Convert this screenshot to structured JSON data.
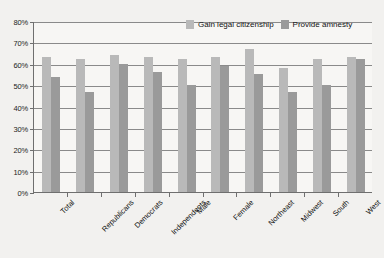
{
  "chart_data": {
    "type": "bar",
    "title": "",
    "xlabel": "",
    "ylabel": "",
    "ylim": [
      0,
      80
    ],
    "ytick_labels": [
      "0%",
      "10%",
      "20%",
      "30%",
      "40%",
      "50%",
      "60%",
      "70%",
      "80%"
    ],
    "ytick_values": [
      0,
      10,
      20,
      30,
      40,
      50,
      60,
      70,
      80
    ],
    "grid": true,
    "legend_position": "top-right-inside",
    "categories": [
      "Total",
      "Republicans",
      "Democrats",
      "Independents",
      "Male",
      "Female",
      "Northeast",
      "Midwest",
      "South",
      "West"
    ],
    "series": [
      {
        "name": "Gain legal citizenship",
        "color": "#b9b9b9",
        "values": [
          63,
          62,
          64,
          63,
          62,
          63,
          67,
          58,
          62,
          63
        ]
      },
      {
        "name": "Provide amnesty",
        "color": "#9a9a9a",
        "values": [
          54,
          47,
          60,
          56,
          50,
          59,
          55,
          47,
          50,
          62
        ]
      }
    ]
  },
  "colors": {
    "background": "#f2f1ef",
    "plot_background": "#f7f6f4",
    "axis": "#6f6f6f",
    "gridline": "#8a8a8a",
    "series_1": "#b9b9b9",
    "series_2": "#9a9a9a"
  }
}
